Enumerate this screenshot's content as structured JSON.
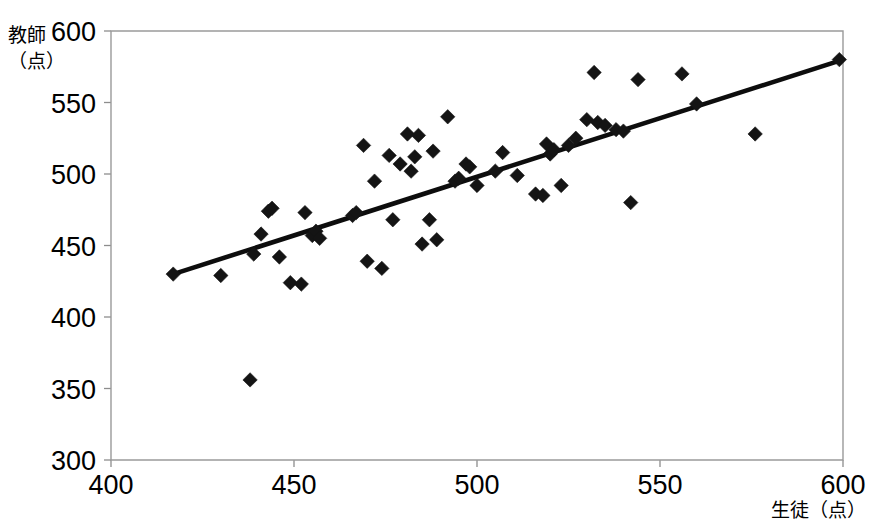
{
  "chart_data": {
    "type": "scatter",
    "title": "",
    "xlabel": "生徒（点）",
    "ylabel_line1": "教師",
    "ylabel_line2": "（点）",
    "xlim": [
      400,
      600
    ],
    "ylim": [
      300,
      600
    ],
    "xticks": [
      400,
      450,
      500,
      550,
      600
    ],
    "yticks": [
      300,
      350,
      400,
      450,
      500,
      550,
      600
    ],
    "xtick_labels": [
      "400",
      "450",
      "500",
      "550",
      "600"
    ],
    "ytick_labels": [
      "300",
      "350",
      "400",
      "450",
      "500",
      "550",
      "600"
    ],
    "grid": false,
    "legend": null,
    "marker": "diamond",
    "marker_color": "#141414",
    "frame_color": "#9a9a9a",
    "trendline": {
      "color": "#0d0d0d",
      "x_start": 417,
      "y_start": 430,
      "x_end": 600,
      "y_end": 580
    },
    "points": [
      [
        417,
        430
      ],
      [
        430,
        429
      ],
      [
        438,
        356
      ],
      [
        439,
        444
      ],
      [
        441,
        458
      ],
      [
        443,
        474
      ],
      [
        444,
        476
      ],
      [
        446,
        442
      ],
      [
        449,
        424
      ],
      [
        452,
        423
      ],
      [
        453,
        473
      ],
      [
        455,
        457
      ],
      [
        456,
        460
      ],
      [
        457,
        455
      ],
      [
        466,
        471
      ],
      [
        467,
        473
      ],
      [
        469,
        520
      ],
      [
        470,
        439
      ],
      [
        472,
        495
      ],
      [
        474,
        434
      ],
      [
        476,
        513
      ],
      [
        477,
        468
      ],
      [
        479,
        507
      ],
      [
        481,
        528
      ],
      [
        482,
        502
      ],
      [
        483,
        512
      ],
      [
        484,
        527
      ],
      [
        485,
        451
      ],
      [
        487,
        468
      ],
      [
        488,
        516
      ],
      [
        489,
        454
      ],
      [
        492,
        540
      ],
      [
        494,
        495
      ],
      [
        495,
        497
      ],
      [
        497,
        507
      ],
      [
        498,
        505
      ],
      [
        500,
        492
      ],
      [
        505,
        502
      ],
      [
        507,
        515
      ],
      [
        511,
        499
      ],
      [
        516,
        486
      ],
      [
        518,
        485
      ],
      [
        519,
        521
      ],
      [
        520,
        514
      ],
      [
        521,
        517
      ],
      [
        523,
        492
      ],
      [
        525,
        520
      ],
      [
        527,
        525
      ],
      [
        530,
        538
      ],
      [
        532,
        571
      ],
      [
        533,
        536
      ],
      [
        535,
        534
      ],
      [
        538,
        531
      ],
      [
        540,
        530
      ],
      [
        542,
        480
      ],
      [
        544,
        566
      ],
      [
        556,
        570
      ],
      [
        560,
        549
      ],
      [
        576,
        528
      ],
      [
        599,
        580
      ]
    ]
  }
}
